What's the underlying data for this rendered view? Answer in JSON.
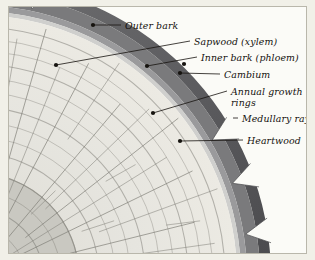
{
  "figure": {
    "kind": "botanical-diagram",
    "frame_color": "#f1f0e8",
    "plate_color": "#fbfbf7",
    "plate_border_color": "#b9b7ab"
  },
  "palette": {
    "outer_bark": "#6f6f71",
    "outer_bark_dark": "#5c5c5f",
    "outer_bark_edge": "#4a4a4d",
    "inner_bark": "#9a9a9c",
    "cambium": "#cfcfcd",
    "sapwood": "#e6e5df",
    "heartwood": "#c9c8c1",
    "ring_line": "#8e8d86",
    "ray_line": "#7d7c75",
    "leader_line": "#16130f",
    "text": "#14110e"
  },
  "labels": [
    {
      "id": "outer-bark",
      "text": "Outer bark",
      "x": 116,
      "y": 13,
      "leader": {
        "x1": 112,
        "y1": 18,
        "x2": 84,
        "y2": 18,
        "dot_x": 84,
        "dot_y": 18
      }
    },
    {
      "id": "sapwood-xylem",
      "text": "Sapwood (xylem)",
      "x": 185,
      "y": 29,
      "leader": {
        "x1": 181,
        "y1": 34,
        "x2": 47,
        "y2": 58,
        "dot_x": 47,
        "dot_y": 58
      }
    },
    {
      "id": "inner-bark-phloem",
      "text": "Inner bark (phloem)",
      "x": 192,
      "y": 45,
      "leader": {
        "x1": 188,
        "y1": 50,
        "x2": 138,
        "y2": 59,
        "dot_x": 138,
        "dot_y": 59
      }
    },
    {
      "id": "cambium",
      "text": "Cambium",
      "x": 215,
      "y": 62,
      "leader": {
        "x1": 211,
        "y1": 67,
        "x2": 171,
        "y2": 66,
        "dot_x": 171,
        "dot_y": 66
      }
    },
    {
      "id": "annual-growth-rings",
      "text": "Annual growth rings",
      "x": 222,
      "y": 79,
      "wrap": true,
      "leader": {
        "x1": 218,
        "y1": 84,
        "x2": 144,
        "y2": 106,
        "dot_x": 144,
        "dot_y": 106
      }
    },
    {
      "id": "medullary-rays",
      "text": "Medullary rays",
      "x": 233,
      "y": 106,
      "leader": {
        "x1": 229,
        "y1": 111,
        "x2": 224,
        "y2": 111,
        "dot_x": null,
        "dot_y": null
      }
    },
    {
      "id": "heartwood",
      "text": "Heartwood",
      "x": 238,
      "y": 128,
      "leader": {
        "x1": 234,
        "y1": 133,
        "x2": 171,
        "y2": 134,
        "dot_x": 171,
        "dot_y": 134
      }
    }
  ],
  "extra_dots": [
    {
      "id": "dot-inner-bark-secondary",
      "x": 175,
      "y": 57
    },
    {
      "id": "dot-heartwood-lower",
      "x": 82,
      "y": 248
    }
  ],
  "geometry": {
    "center_x": -34,
    "center_y": 270,
    "bark_outer_radius": 296,
    "bark_mid_radius": 285,
    "inner_bark_radius": 272,
    "cambium_radius": 266,
    "sapwood_radius": 262,
    "heartwood_radius": 104,
    "growth_ring_radii": [
      250,
      238,
      226,
      213,
      199,
      185,
      170,
      155,
      140,
      124,
      104,
      86,
      68,
      50,
      32
    ],
    "ray_angles_deg": [
      2,
      8,
      14,
      20,
      26,
      32,
      38,
      44,
      50,
      56,
      62,
      68,
      74,
      80,
      86
    ],
    "bark_notches_deg": [
      78,
      83,
      30,
      20,
      9
    ]
  }
}
